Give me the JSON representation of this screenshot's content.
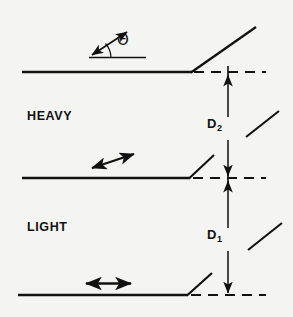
{
  "figure": {
    "background_color": "#f4f4f2",
    "ink_color": "#111111",
    "width": 293,
    "height": 317
  },
  "labels": {
    "heavy": "HEAVY",
    "light": "LIGHT",
    "theta": "Θ",
    "dimension_upper_symbol": "D",
    "dimension_upper_subscript": "2",
    "dimension_lower_symbol": "D",
    "dimension_lower_subscript": "1"
  },
  "diagram_data": {
    "type": "technical-line-diagram",
    "description": "Three horizontal interface lines each terminating in an upward slope at x≈192, with dashed horizontal continuations to the right and a dashed vertical reference line at x≈228. Vertical dimension arrows D2 and D1 measure the offsets between successive interface levels.",
    "interface_lines": [
      {
        "name": "top-interface",
        "y": 72,
        "x_start": 22,
        "x_break": 192,
        "slope_end_x": 255,
        "slope_end_y": 28,
        "dashed_continuation_to_x": 265
      },
      {
        "name": "middle-interface",
        "y": 178,
        "x_start": 22,
        "x_break": 190,
        "slope_end_x": 213,
        "slope_end_y": 155,
        "dashed_continuation_to_x": 265
      },
      {
        "name": "bottom-interface",
        "y": 295,
        "x_start": 18,
        "x_break": 188,
        "slope_end_x": 211,
        "slope_end_y": 274,
        "dashed_continuation_to_x": 265
      }
    ],
    "reference_line": {
      "name": "vertical-dashed-reference",
      "x": 228,
      "y_top": 72,
      "y_bottom": 295
    },
    "dimensions": [
      {
        "label": "D2",
        "x": 228,
        "y_top": 72,
        "y_bottom": 178,
        "arrowheads": "both"
      },
      {
        "label": "D1",
        "x": 228,
        "y_top": 178,
        "y_bottom": 295,
        "arrowheads": "both"
      }
    ],
    "detached_slope_segments": [
      {
        "name": "upper-right-segment",
        "x1": 246,
        "y1": 136,
        "x2": 278,
        "y2": 112
      },
      {
        "name": "lower-right-segment",
        "x1": 248,
        "y1": 249,
        "x2": 281,
        "y2": 224
      }
    ],
    "motion_arrows": [
      {
        "name": "diagonal-motion-arrow",
        "heads": "double",
        "x1": 92,
        "y1": 167,
        "x2": 133,
        "y2": 155
      },
      {
        "name": "horizontal-motion-arrow",
        "heads": "double",
        "x1": 85,
        "y1": 283,
        "x2": 131,
        "y2": 283
      }
    ],
    "angle_indicator": {
      "name": "theta-angle",
      "vertex_x": 89,
      "vertex_y": 57,
      "baseline_end_x": 146,
      "baseline_end_y": 57,
      "ray_end_x": 129,
      "ray_end_y": 30,
      "arrowheads": "both-on-ray",
      "arc_radius": 22
    }
  }
}
